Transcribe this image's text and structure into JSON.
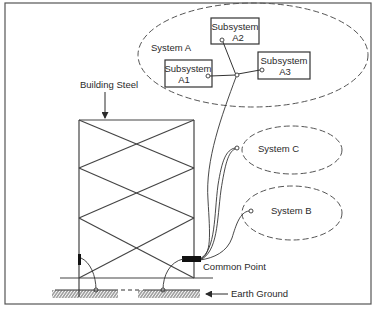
{
  "diagram": {
    "colors": {
      "background": "#ffffff",
      "ink": "#2a2a2a",
      "frame": "#5a5a5a"
    },
    "labels": {
      "building_steel": "Building Steel",
      "system_a": "System A",
      "system_b": "System B",
      "system_c": "System C",
      "common_point": "Common Point",
      "earth_ground": "Earth Ground"
    },
    "subsystems": [
      {
        "id": "A1",
        "line1": "Subsystem",
        "line2": "A1"
      },
      {
        "id": "A2",
        "line1": "Subsystem",
        "line2": "A2"
      },
      {
        "id": "A3",
        "line1": "Subsystem",
        "line2": "A3"
      }
    ],
    "nodes": [
      {
        "name": "System A",
        "type": "dashed-ellipse",
        "contains": [
          "Subsystem A1",
          "Subsystem A2",
          "Subsystem A3"
        ]
      },
      {
        "name": "System B",
        "type": "dashed-ellipse"
      },
      {
        "name": "System C",
        "type": "dashed-ellipse"
      },
      {
        "name": "Building Steel",
        "type": "cross-braced frame"
      },
      {
        "name": "Common Point",
        "type": "bonding bar"
      },
      {
        "name": "Earth Ground",
        "type": "ground hatch"
      }
    ],
    "edges": [
      {
        "from": "Subsystem A1",
        "to": "System A junction"
      },
      {
        "from": "Subsystem A2",
        "to": "System A junction"
      },
      {
        "from": "Subsystem A3",
        "to": "System A junction"
      },
      {
        "from": "System A junction",
        "to": "Common Point"
      },
      {
        "from": "System C",
        "to": "Common Point"
      },
      {
        "from": "System B",
        "to": "Common Point"
      },
      {
        "from": "Building Steel (left column)",
        "to": "Earth Ground"
      },
      {
        "from": "Common Point",
        "to": "Earth Ground"
      }
    ]
  }
}
